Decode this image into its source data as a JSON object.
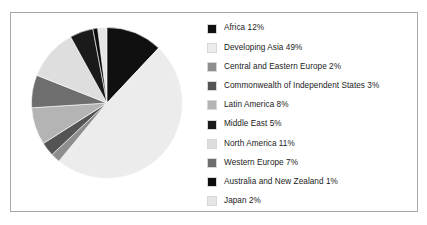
{
  "page": {
    "cropped_caption_fragment": "",
    "background_color": "#ffffff",
    "frame_border_color": "#a8a8a8"
  },
  "chart_data": {
    "type": "pie",
    "title": "",
    "subtitle": "",
    "xlabel": "",
    "ylabel": "",
    "grid": false,
    "legend_position": "right",
    "start_angle_deg": 0,
    "direction": "clockwise",
    "units": "percent",
    "total": 100,
    "categories": [
      "Africa",
      "Developing Asia",
      "Central and Eastern Europe",
      "Commonwealth of Independent States",
      "Latin America",
      "Middle East",
      "North America",
      "Western Europe",
      "Australia and New Zealand",
      "Japan"
    ],
    "values": [
      12,
      49,
      2,
      3,
      8,
      5,
      11,
      7,
      1,
      2
    ],
    "colors": [
      "#101010",
      "#ececec",
      "#8e8e8e",
      "#545454",
      "#b4b4b4",
      "#1a1a1a",
      "#dedede",
      "#6e6e6e",
      "#0d0d0d",
      "#e6e6e6"
    ],
    "slices": [
      {
        "label": "Africa",
        "value": 12,
        "color": "#101010"
      },
      {
        "label": "Developing Asia",
        "value": 49,
        "color": "#ececec"
      },
      {
        "label": "Central and Eastern Europe",
        "value": 2,
        "color": "#8e8e8e"
      },
      {
        "label": "Commonwealth of Independent States",
        "value": 3,
        "color": "#545454"
      },
      {
        "label": "Latin America",
        "value": 8,
        "color": "#b4b4b4"
      },
      {
        "label": "Middle East",
        "value": 5,
        "color": "#1a1a1a"
      },
      {
        "label": "North America",
        "value": 11,
        "color": "#dedede"
      },
      {
        "label": "Western Europe",
        "value": 7,
        "color": "#6e6e6e"
      },
      {
        "label": "Australia and New Zealand",
        "value": 1,
        "color": "#0d0d0d"
      },
      {
        "label": "Japan",
        "value": 2,
        "color": "#e6e6e6"
      }
    ]
  },
  "legend": {
    "items": [
      {
        "label": "Africa 12%",
        "color": "#101010"
      },
      {
        "label": "Developing Asia 49%",
        "color": "#ececec"
      },
      {
        "label": "Central and Eastern Europe 2%",
        "color": "#8e8e8e"
      },
      {
        "label": "Commonwealth of Independent States 3%",
        "color": "#545454"
      },
      {
        "label": "Latin America 8%",
        "color": "#b4b4b4"
      },
      {
        "label": "Middle East 5%",
        "color": "#1a1a1a"
      },
      {
        "label": "North America 11%",
        "color": "#dedede"
      },
      {
        "label": "Western Europe 7%",
        "color": "#6e6e6e"
      },
      {
        "label": "Australia and New Zealand 1%",
        "color": "#0d0d0d"
      },
      {
        "label": "Japan 2%",
        "color": "#e6e6e6"
      }
    ]
  }
}
